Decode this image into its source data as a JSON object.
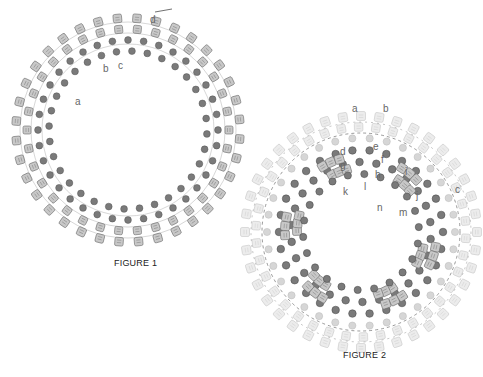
{
  "figures": [
    {
      "id": "figure-1",
      "caption": "FIGURE 1",
      "center": [
        128,
        130
      ],
      "labels": [
        "a",
        "b",
        "c",
        "d"
      ]
    },
    {
      "id": "figure-2",
      "caption": "FIGURE 2",
      "center": [
        361,
        232
      ],
      "labels": [
        "a",
        "b",
        "c",
        "d",
        "e",
        "f",
        "g",
        "h",
        "i",
        "j",
        "k",
        "l",
        "m",
        "n"
      ]
    }
  ],
  "colors": {
    "cube_fill": "#c8c8c8",
    "cube_stroke": "#6a6a6a",
    "round_fill": "#7a7a7a",
    "ghost_cube_fill": "#ececec",
    "ghost_round_fill": "#d6d6d6",
    "thread": "#555555"
  }
}
